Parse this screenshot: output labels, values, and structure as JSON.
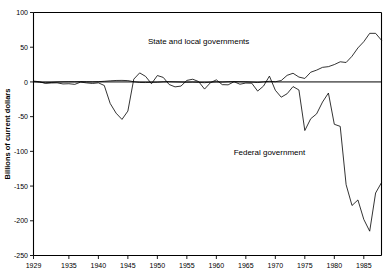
{
  "chart_data": {
    "type": "line",
    "title": "",
    "xlabel": "",
    "ylabel": "Billions of current dollars",
    "xlim": [
      1929,
      1988
    ],
    "ylim": [
      -250,
      100
    ],
    "grid": false,
    "legend_position": "inline-annotations",
    "ytick_labels": [
      "100",
      "50",
      "0",
      "-50",
      "-100",
      "-150",
      "-200",
      "-250"
    ],
    "ytick_values": [
      100,
      50,
      0,
      -50,
      -100,
      -150,
      -200,
      -250
    ],
    "xtick_labels": [
      "1929",
      "1935",
      "1940",
      "1945",
      "1950",
      "1955",
      "1960",
      "1965",
      "1970",
      "1975",
      "1980",
      "1985"
    ],
    "xtick_values": [
      1929,
      1935,
      1940,
      1945,
      1950,
      1955,
      1960,
      1965,
      1970,
      1975,
      1980,
      1985
    ],
    "annotations": [
      {
        "text": "State and local governments",
        "x": 1957,
        "y": 55
      },
      {
        "text": "Federal government",
        "x": 1969,
        "y": -105
      }
    ],
    "series": [
      {
        "name": "State and local governments",
        "x": [
          1929,
          1930,
          1931,
          1932,
          1933,
          1934,
          1935,
          1936,
          1937,
          1938,
          1939,
          1940,
          1941,
          1942,
          1943,
          1944,
          1945,
          1946,
          1947,
          1948,
          1949,
          1950,
          1951,
          1952,
          1953,
          1954,
          1955,
          1956,
          1957,
          1958,
          1959,
          1960,
          1961,
          1962,
          1963,
          1964,
          1965,
          1966,
          1967,
          1968,
          1969,
          1970,
          1971,
          1972,
          1973,
          1974,
          1975,
          1976,
          1977,
          1978,
          1979,
          1980,
          1981,
          1982,
          1983,
          1984,
          1985,
          1986,
          1987,
          1988
        ],
        "values": [
          0.5,
          -0.4,
          -1.2,
          -0.8,
          -0.2,
          0.1,
          0.3,
          0.2,
          0.4,
          0.2,
          0.1,
          0.4,
          0.9,
          1.6,
          2.1,
          2.2,
          1.9,
          0.3,
          -0.8,
          -0.9,
          -0.6,
          -0.5,
          0.2,
          0.4,
          0.1,
          -0.2,
          -0.5,
          -0.3,
          -0.6,
          -1.1,
          -0.4,
          0.1,
          -0.2,
          0.3,
          0.5,
          0.4,
          0.2,
          -0.3,
          -0.9,
          0.1,
          0.9,
          0.3,
          2.0,
          9.5,
          12.5,
          7.0,
          5.0,
          14.0,
          17.0,
          21.0,
          22.0,
          25.0,
          29.0,
          28.0,
          37.0,
          49.0,
          58.0,
          70.0,
          70.0,
          60.0
        ]
      },
      {
        "name": "Federal government",
        "x": [
          1929,
          1930,
          1931,
          1932,
          1933,
          1934,
          1935,
          1936,
          1937,
          1938,
          1939,
          1940,
          1941,
          1942,
          1943,
          1944,
          1945,
          1946,
          1947,
          1948,
          1949,
          1950,
          1951,
          1952,
          1953,
          1954,
          1955,
          1956,
          1957,
          1958,
          1959,
          1960,
          1961,
          1962,
          1963,
          1964,
          1965,
          1966,
          1967,
          1968,
          1969,
          1970,
          1971,
          1972,
          1973,
          1974,
          1975,
          1976,
          1977,
          1978,
          1979,
          1980,
          1981,
          1982,
          1983,
          1984,
          1985,
          1986,
          1987,
          1988
        ],
        "values": [
          1.2,
          0.3,
          -2.1,
          -1.5,
          -1.3,
          -2.9,
          -2.6,
          -3.5,
          -0.2,
          -1.4,
          -2.2,
          -1.3,
          -5.1,
          -31.0,
          -45.0,
          -54.0,
          -42.0,
          4.0,
          13.0,
          8.0,
          -2.6,
          9.2,
          6.5,
          -3.7,
          -7.1,
          -6.0,
          2.2,
          3.9,
          0.5,
          -10.3,
          -1.1,
          3.0,
          -3.9,
          -4.2,
          0.3,
          -3.3,
          -1.6,
          -1.8,
          -13.2,
          -6.0,
          8.4,
          -12.0,
          -22.0,
          -17.0,
          -6.7,
          -11.6,
          -70.0,
          -53.0,
          -46.0,
          -29.0,
          -16.0,
          -61.0,
          -64.0,
          -148.0,
          -178.0,
          -170.0,
          -198.0,
          -215.0,
          -160.0,
          -145.0
        ]
      }
    ]
  }
}
